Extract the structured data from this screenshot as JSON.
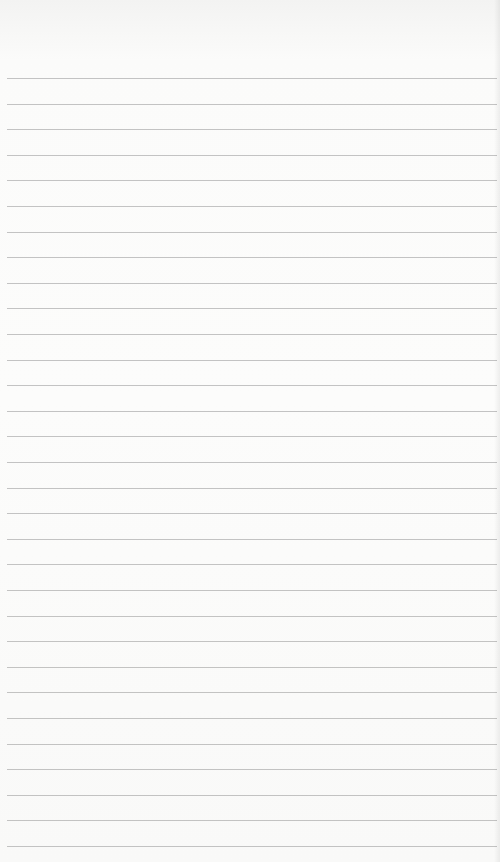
{
  "page": {
    "type": "blank-lined-paper",
    "background_color": "#fbfbfa",
    "rule_color": "#b8b8b8",
    "first_rule_y": 78,
    "rule_spacing": 25.6,
    "rule_count": 31,
    "text": ""
  }
}
